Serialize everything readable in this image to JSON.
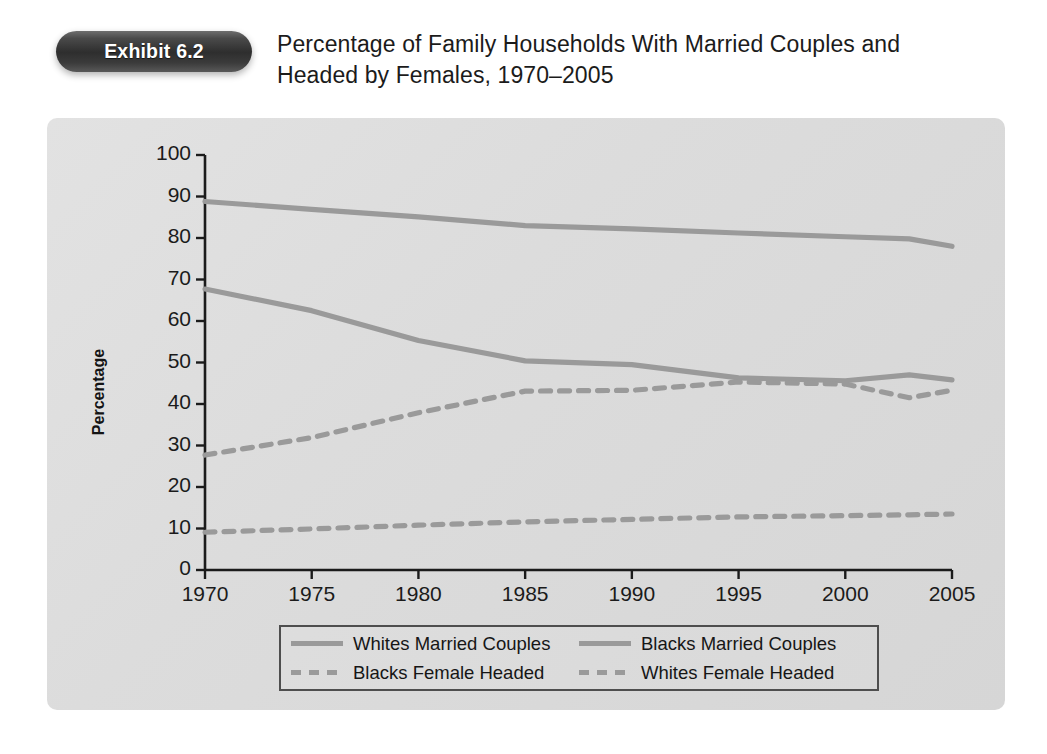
{
  "exhibit": {
    "badge_label": "Exhibit 6.2",
    "title_line1": "Percentage of Family Households With Married Couples and",
    "title_line2": "Headed by Females, 1970–2005"
  },
  "colors": {
    "panel_bg": "#dcdcdc",
    "line": "#9a9a9a",
    "axis": "#1b1b1b",
    "badge": "#2e2e2e",
    "text": "#1b1b1b"
  },
  "legend": {
    "items": [
      {
        "label": "Whites Married Couples",
        "style": "solid"
      },
      {
        "label": "Blacks Married Couples",
        "style": "solid"
      },
      {
        "label": "Blacks Female Headed",
        "style": "dashed"
      },
      {
        "label": "Whites Female Headed",
        "style": "dashed"
      }
    ]
  },
  "axes": {
    "y_ticks": [
      "100",
      "90",
      "80",
      "70",
      "60",
      "50",
      "40",
      "30",
      "20",
      "10",
      "0"
    ],
    "x_ticks": [
      "1970",
      "1975",
      "1980",
      "1985",
      "1990",
      "1995",
      "2000",
      "2005"
    ],
    "y_title": "Percentage"
  },
  "chart_data": {
    "type": "line",
    "title": "Percentage of Family Households With Married Couples and Headed by Females, 1970–2005",
    "xlabel": "",
    "ylabel": "Percentage",
    "xlim": [
      1970,
      2005
    ],
    "ylim": [
      0,
      100
    ],
    "ytick_step": 10,
    "xtick_step": 5,
    "grid": false,
    "legend_position": "bottom",
    "x": [
      1970,
      1975,
      1980,
      1985,
      1990,
      1995,
      2000,
      2003,
      2005
    ],
    "series": [
      {
        "name": "Whites Married Couples",
        "style": "solid",
        "color": "#9a9a9a",
        "values": [
          88.8,
          86.9,
          85.1,
          83.0,
          82.2,
          81.2,
          80.3,
          79.8,
          78.0
        ]
      },
      {
        "name": "Blacks Married Couples",
        "style": "solid",
        "color": "#9a9a9a",
        "values": [
          67.7,
          62.5,
          55.3,
          50.4,
          49.5,
          46.3,
          45.6,
          47.0,
          45.8
        ]
      },
      {
        "name": "Blacks Female Headed",
        "style": "dashed",
        "color": "#9a9a9a",
        "values": [
          27.7,
          31.9,
          37.9,
          43.1,
          43.3,
          45.3,
          44.8,
          41.5,
          43.3
        ]
      },
      {
        "name": "Whites Female Headed",
        "style": "dashed",
        "color": "#9a9a9a",
        "values": [
          9.1,
          9.9,
          10.8,
          11.6,
          12.2,
          12.8,
          13.1,
          13.3,
          13.5
        ]
      }
    ]
  }
}
